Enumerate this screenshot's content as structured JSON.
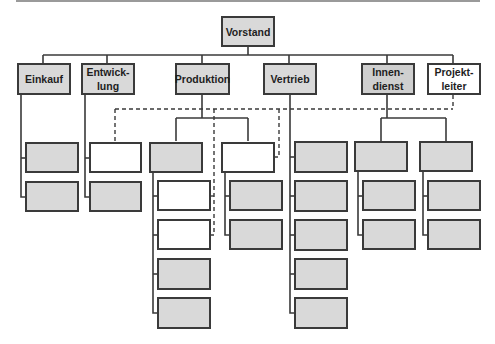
{
  "colors": {
    "box_fill_gray": "#d9d9d9",
    "box_fill_white": "#ffffff",
    "border": "#3a3a3a",
    "line": "#3a3a3a"
  },
  "chart": {
    "root": {
      "label": "Vorstand"
    },
    "departments": [
      {
        "id": "einkauf",
        "label": "Einkauf",
        "fill": "gray"
      },
      {
        "id": "entwicklung",
        "label": "Entwick-\nlung",
        "fill": "gray"
      },
      {
        "id": "produktion",
        "label": "Produktion",
        "fill": "gray"
      },
      {
        "id": "vertrieb",
        "label": "Vertrieb",
        "fill": "gray"
      },
      {
        "id": "innendienst",
        "label": "Innen-\ndienst",
        "fill": "gray"
      },
      {
        "id": "projektleiter",
        "label": "Projekt-\nleiter",
        "fill": "white",
        "relation": "dashed matrix lines"
      }
    ],
    "sub_units": {
      "einkauf": [
        "gray",
        "gray"
      ],
      "entwicklung": [
        "white",
        "gray"
      ],
      "produktion_left": {
        "head": "gray",
        "children": [
          "white",
          "white",
          "gray",
          "gray"
        ]
      },
      "produktion_right": {
        "head": "white",
        "children": [
          "gray",
          "gray"
        ]
      },
      "vertrieb": [
        "gray",
        "gray",
        "gray",
        "gray",
        "gray"
      ],
      "innendienst_left": {
        "head": "gray",
        "children": [
          "gray",
          "gray"
        ]
      },
      "innendienst_right": {
        "head": "gray",
        "children": [
          "gray",
          "gray"
        ]
      }
    }
  }
}
